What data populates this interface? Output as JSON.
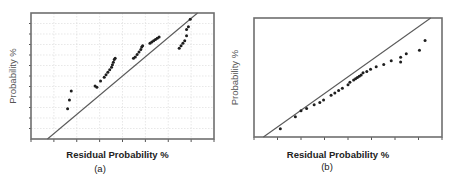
{
  "chart_data": [
    {
      "type": "scatter",
      "panel_label": "(a)",
      "title": "",
      "xlabel": "Residual Probability %",
      "ylabel": "Probability %",
      "xlim": [
        0,
        100
      ],
      "ylim": [
        0,
        100
      ],
      "grid": true,
      "xticks": 8,
      "yticks": 12,
      "fit_line": {
        "x": [
          9,
          91
        ],
        "y": [
          0,
          100
        ]
      },
      "points": [
        {
          "x": 20,
          "y": 24
        },
        {
          "x": 21,
          "y": 31
        },
        {
          "x": 22,
          "y": 38
        },
        {
          "x": 35,
          "y": 42
        },
        {
          "x": 36,
          "y": 41
        },
        {
          "x": 38,
          "y": 46
        },
        {
          "x": 40,
          "y": 49
        },
        {
          "x": 41,
          "y": 51
        },
        {
          "x": 42,
          "y": 53
        },
        {
          "x": 43,
          "y": 55
        },
        {
          "x": 44,
          "y": 57
        },
        {
          "x": 44.5,
          "y": 59
        },
        {
          "x": 45,
          "y": 61
        },
        {
          "x": 45.5,
          "y": 63
        },
        {
          "x": 46,
          "y": 64
        },
        {
          "x": 56,
          "y": 64
        },
        {
          "x": 57,
          "y": 65
        },
        {
          "x": 58,
          "y": 67
        },
        {
          "x": 59,
          "y": 69
        },
        {
          "x": 60,
          "y": 71
        },
        {
          "x": 60.5,
          "y": 73
        },
        {
          "x": 61,
          "y": 74
        },
        {
          "x": 65,
          "y": 76
        },
        {
          "x": 66,
          "y": 77
        },
        {
          "x": 67,
          "y": 78
        },
        {
          "x": 68,
          "y": 79
        },
        {
          "x": 69,
          "y": 80
        },
        {
          "x": 70,
          "y": 81
        },
        {
          "x": 81,
          "y": 72
        },
        {
          "x": 82,
          "y": 74
        },
        {
          "x": 83,
          "y": 76
        },
        {
          "x": 84,
          "y": 78
        },
        {
          "x": 85,
          "y": 82
        },
        {
          "x": 85,
          "y": 87
        },
        {
          "x": 86,
          "y": 89
        },
        {
          "x": 87,
          "y": 95
        }
      ]
    },
    {
      "type": "scatter",
      "panel_label": "(b)",
      "title": "",
      "xlabel": "Residual Probability %",
      "ylabel": "Probability %",
      "xlim": [
        0,
        100
      ],
      "ylim": [
        0,
        100
      ],
      "grid": false,
      "xticks": 8,
      "yticks": 0,
      "fit_line": {
        "x": [
          5,
          94
        ],
        "y": [
          0,
          100
        ]
      },
      "points": [
        {
          "x": 14,
          "y": 7
        },
        {
          "x": 22,
          "y": 17
        },
        {
          "x": 25,
          "y": 22
        },
        {
          "x": 28,
          "y": 24
        },
        {
          "x": 32,
          "y": 27
        },
        {
          "x": 35,
          "y": 29
        },
        {
          "x": 37,
          "y": 31
        },
        {
          "x": 41,
          "y": 35
        },
        {
          "x": 43,
          "y": 37
        },
        {
          "x": 45,
          "y": 39
        },
        {
          "x": 47,
          "y": 41
        },
        {
          "x": 50,
          "y": 44
        },
        {
          "x": 51,
          "y": 46
        },
        {
          "x": 53,
          "y": 48
        },
        {
          "x": 54,
          "y": 49
        },
        {
          "x": 55,
          "y": 50
        },
        {
          "x": 56,
          "y": 51
        },
        {
          "x": 57,
          "y": 52
        },
        {
          "x": 58,
          "y": 54
        },
        {
          "x": 60,
          "y": 55
        },
        {
          "x": 62,
          "y": 57
        },
        {
          "x": 65,
          "y": 59
        },
        {
          "x": 69,
          "y": 61
        },
        {
          "x": 73,
          "y": 64
        },
        {
          "x": 78,
          "y": 63
        },
        {
          "x": 78,
          "y": 67
        },
        {
          "x": 81,
          "y": 70
        },
        {
          "x": 88,
          "y": 73
        },
        {
          "x": 91,
          "y": 81
        }
      ]
    }
  ]
}
